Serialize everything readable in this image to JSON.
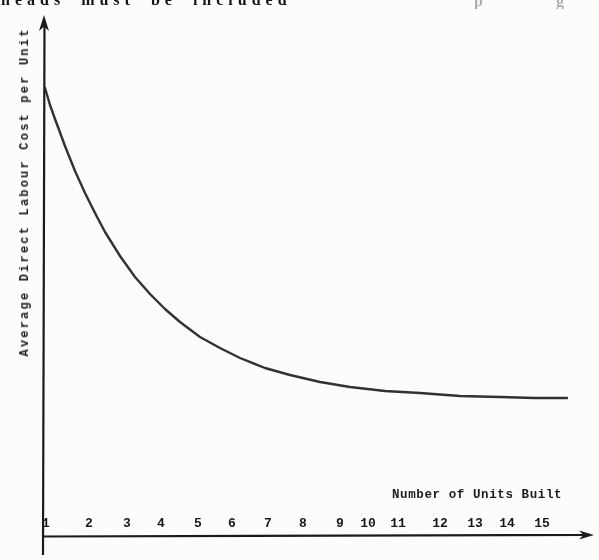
{
  "page": {
    "top_fragment": {
      "text": "heads must be included",
      "faint_marks": [
        "p",
        "g"
      ]
    }
  },
  "chart": {
    "xlabel": "Number of Units Built",
    "ylabel": "Average Direct Labour Cost per Unit"
  },
  "chart_data": {
    "type": "line",
    "title": "",
    "xlabel": "Number of Units Built",
    "ylabel": "Average Direct Labour Cost per Unit",
    "x_ticks": [
      "1",
      "2",
      "3",
      "4",
      "5",
      "6",
      "7",
      "8",
      "9",
      "10",
      "11",
      "12",
      "13",
      "14",
      "15"
    ],
    "y_ticks": [],
    "x": [
      1,
      2,
      3,
      4,
      5,
      6,
      7,
      8,
      9,
      10,
      11,
      12,
      13,
      14,
      15
    ],
    "y_relative_cost": [
      1.0,
      0.78,
      0.63,
      0.54,
      0.47,
      0.42,
      0.39,
      0.37,
      0.35,
      0.34,
      0.33,
      0.325,
      0.32,
      0.315,
      0.31
    ],
    "y_scale_note": "no numeric y-axis scale shown; values relative to cost of unit 1",
    "grid": false,
    "legend": "none",
    "x_axis_arrow": true,
    "y_axis_arrow": true,
    "layout_px": {
      "x_tick_px": [
        46,
        89,
        127,
        161,
        198,
        232,
        268,
        303,
        340,
        368,
        398,
        440,
        475,
        507,
        542
      ],
      "curve_px": [
        [
          45,
          88
        ],
        [
          50,
          105
        ],
        [
          55,
          119
        ],
        [
          65,
          146
        ],
        [
          75,
          171
        ],
        [
          85,
          193
        ],
        [
          95,
          213
        ],
        [
          105,
          232
        ],
        [
          120,
          256
        ],
        [
          135,
          277
        ],
        [
          150,
          294
        ],
        [
          165,
          309
        ],
        [
          180,
          322
        ],
        [
          200,
          337
        ],
        [
          220,
          348
        ],
        [
          240,
          358
        ],
        [
          265,
          368
        ],
        [
          290,
          375
        ],
        [
          320,
          382
        ],
        [
          350,
          387
        ],
        [
          385,
          391
        ],
        [
          420,
          393
        ],
        [
          460,
          396
        ],
        [
          500,
          397
        ],
        [
          535,
          398
        ],
        [
          567,
          398
        ]
      ]
    }
  },
  "colors": {
    "ink": "#1b1b1b",
    "curve": "#222222",
    "paper": "#fcfcfa"
  }
}
